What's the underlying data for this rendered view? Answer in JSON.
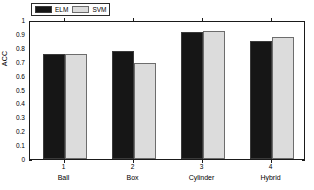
{
  "chart_data": {
    "type": "bar",
    "title": "",
    "xlabel": "",
    "ylabel": "ACC",
    "ylim": [
      0,
      1
    ],
    "ytick_labels": [
      "0",
      "0.1",
      "0.2",
      "0.3",
      "0.4",
      "0.5",
      "0.6",
      "0.7",
      "0.8",
      "0.9",
      "1"
    ],
    "ytick_values": [
      0,
      0.1,
      0.2,
      0.3,
      0.4,
      0.5,
      0.6,
      0.7,
      0.8,
      0.9,
      1
    ],
    "categories": [
      "Ball",
      "Box",
      "Cylinder",
      "Hybrid"
    ],
    "xtick_labels": [
      "1",
      "2",
      "3",
      "4"
    ],
    "grid": false,
    "legend_position": "top-left",
    "series": [
      {
        "name": "ELM",
        "color": "#161616",
        "values": [
          0.755,
          0.777,
          0.912,
          0.849
        ]
      },
      {
        "name": "SVM",
        "color": "#dcdcdc",
        "values": [
          0.757,
          0.691,
          0.922,
          0.877
        ]
      }
    ]
  }
}
